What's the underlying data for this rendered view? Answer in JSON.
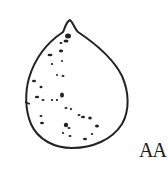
{
  "figure": {
    "label": "AA",
    "stroke_color": "#222222",
    "background": "#ffffff"
  }
}
